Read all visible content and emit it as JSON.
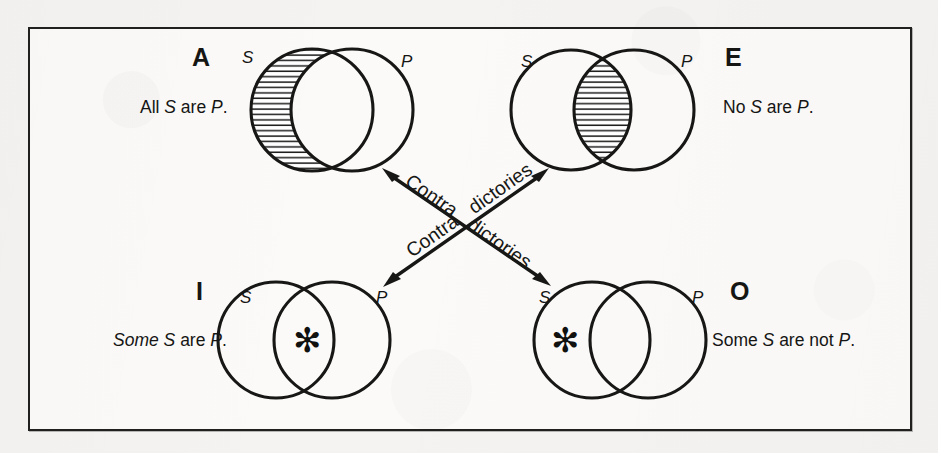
{
  "figure": {
    "background_color": "#f4f3f1",
    "panel_color": "#fbfaf8",
    "ink_color": "#20201f"
  },
  "quadrants": {
    "A": {
      "letter": "A",
      "statement_prefix": "All ",
      "subject": "S",
      "statement_middle": " are ",
      "predicate": "P",
      "statement_suffix": ".",
      "statement_plain": "All S are P.",
      "left_circle_label": "S",
      "right_circle_label": "P",
      "shaded_region": "S-only crescent",
      "mark": "none"
    },
    "E": {
      "letter": "E",
      "statement_prefix": "No ",
      "subject": "S",
      "statement_middle": " are ",
      "predicate": "P",
      "statement_suffix": ".",
      "statement_plain": "No S are P.",
      "left_circle_label": "S",
      "right_circle_label": "P",
      "shaded_region": "intersection lens",
      "mark": "none"
    },
    "I": {
      "letter": "I",
      "statement_prefix": "Some ",
      "subject": "S",
      "statement_middle": " are ",
      "predicate": "P",
      "statement_suffix": ".",
      "statement_plain": "Some S are P.",
      "left_circle_label": "S",
      "right_circle_label": "P",
      "shaded_region": "none",
      "mark": "asterisk in intersection",
      "mark_glyph": "✻"
    },
    "O": {
      "letter": "O",
      "statement_prefix": "Some ",
      "subject": "S",
      "statement_middle": " are not ",
      "predicate": "P",
      "statement_suffix": ".",
      "statement_plain": "Some S are not P.",
      "left_circle_label": "S",
      "right_circle_label": "P",
      "shaded_region": "none",
      "mark": "asterisk in S-only region",
      "mark_glyph": "✻"
    }
  },
  "relations": {
    "diagonal_a_o": {
      "label_word_one": "Contra",
      "label_word_two": "dictories",
      "label_full": "Contra dictories",
      "from": "A",
      "to": "O",
      "arrowheads": "both"
    },
    "diagonal_e_i": {
      "label_word_one": "Contra",
      "label_word_two": "dictories",
      "label_full": "Contra dictories",
      "from": "E",
      "to": "I",
      "arrowheads": "both"
    }
  }
}
